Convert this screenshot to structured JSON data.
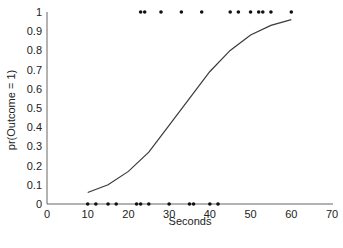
{
  "chart_data": {
    "type": "scatter",
    "title": "",
    "xlabel": "Seconds",
    "ylabel": "pr(Outcome = 1)",
    "xlim": [
      0,
      70
    ],
    "ylim": [
      0,
      1
    ],
    "xticks": [
      0,
      10,
      20,
      30,
      40,
      50,
      60,
      70
    ],
    "yticks": [
      0,
      0.1,
      0.2,
      0.3,
      0.4,
      0.5,
      0.6,
      0.7,
      0.8,
      0.9,
      1
    ],
    "ytick_labels": [
      "0",
      "0.1",
      "0.2",
      "0.3",
      "0.4",
      "0.5",
      "0.6",
      "0.7",
      "0.8",
      "0.9",
      "1"
    ],
    "grid": false,
    "legend": null,
    "series": [
      {
        "name": "Outcome = 0",
        "type": "scatter",
        "x": [
          10,
          12,
          15,
          17,
          22,
          23,
          25,
          30,
          35,
          36,
          40,
          42
        ],
        "y": [
          0,
          0,
          0,
          0,
          0,
          0,
          0,
          0,
          0,
          0,
          0,
          0
        ]
      },
      {
        "name": "Outcome = 1",
        "type": "scatter",
        "x": [
          23,
          24,
          28,
          33,
          38,
          45,
          47,
          50,
          52,
          53,
          55,
          60
        ],
        "y": [
          1,
          1,
          1,
          1,
          1,
          1,
          1,
          1,
          1,
          1,
          1,
          1
        ]
      },
      {
        "name": "Logistic fit",
        "type": "line",
        "x": [
          10,
          15,
          20,
          25,
          30,
          35,
          40,
          45,
          50,
          55,
          60
        ],
        "y": [
          0.06,
          0.1,
          0.17,
          0.27,
          0.41,
          0.55,
          0.69,
          0.8,
          0.88,
          0.93,
          0.96
        ]
      }
    ],
    "colors": {
      "line": "#3a3a3a",
      "points": "#111111",
      "axis": "#555555"
    }
  }
}
